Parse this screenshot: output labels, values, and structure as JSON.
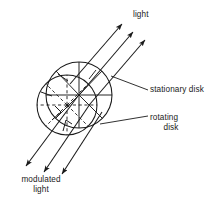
{
  "figure": {
    "labels": {
      "light": "light",
      "stationary_disk": "stationary disk",
      "rotating_disk": "rotating disk",
      "modulated_light_line1": "modulated",
      "modulated_light_line2": "light"
    },
    "colors": {
      "stroke": "#1a1a1a",
      "background": "#ffffff",
      "text": "#1a1a1a"
    },
    "elements": {
      "incoming_beams": 3,
      "outgoing_beams": 3,
      "disks": 2,
      "disk_sectors": 8
    }
  }
}
